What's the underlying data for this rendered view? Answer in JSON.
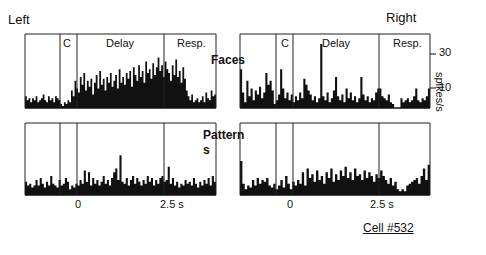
{
  "labels": {
    "left": "Left",
    "right": "Right",
    "faces": "Faces",
    "patterns_line1": "Pattern",
    "patterns_line2": "s",
    "epoch_c": "C",
    "epoch_delay": "Delay",
    "epoch_resp": "Resp.",
    "ytick_30": "30",
    "ytick_10": "10",
    "ylabel": "spikes/s",
    "xtick_0": "0",
    "xtick_25": "2.5 s",
    "cell": "Cell #532"
  },
  "chart_data": {
    "type": "bar",
    "title": "Cell #532",
    "ylabel": "spikes/s",
    "yticks": [
      10,
      30
    ],
    "xticks": [
      "0",
      "2.5 s"
    ],
    "epochs": [
      "C",
      "Delay",
      "Resp."
    ],
    "panels": [
      {
        "name": "Faces-Left",
        "row": "Faces",
        "side": "Left",
        "values": [
          6,
          4,
          5,
          3,
          5,
          4,
          6,
          3,
          4,
          5,
          7,
          4,
          3,
          6,
          4,
          5,
          3,
          6,
          5,
          4,
          2,
          1,
          3,
          2,
          4,
          3,
          9,
          6,
          14,
          10,
          8,
          16,
          12,
          18,
          9,
          14,
          11,
          15,
          7,
          13,
          17,
          10,
          19,
          12,
          15,
          9,
          16,
          13,
          18,
          11,
          14,
          17,
          10,
          20,
          13,
          16,
          12,
          18,
          15,
          19,
          11,
          21,
          17,
          14,
          22,
          16,
          19,
          13,
          24,
          18,
          20,
          15,
          23,
          17,
          21,
          26,
          19,
          22,
          16,
          24,
          20,
          18,
          14,
          22,
          17,
          25,
          16,
          19,
          13,
          21,
          15,
          9,
          6,
          4,
          7,
          3,
          4,
          5,
          3,
          4,
          6,
          3,
          8,
          5,
          4,
          9,
          6,
          7
        ]
      },
      {
        "name": "Faces-Right",
        "row": "Faces",
        "side": "Right",
        "values": [
          20,
          8,
          3,
          14,
          6,
          10,
          4,
          9,
          7,
          11,
          5,
          8,
          18,
          12,
          14,
          9,
          2,
          4,
          7,
          20,
          10,
          5,
          8,
          4,
          7,
          3,
          6,
          4,
          8,
          5,
          15,
          12,
          9,
          7,
          4,
          6,
          3,
          5,
          33,
          6,
          4,
          8,
          3,
          5,
          9,
          16,
          6,
          4,
          7,
          3,
          10,
          5,
          8,
          4,
          6,
          3,
          5,
          16,
          7,
          4,
          6,
          3,
          5,
          4,
          8,
          10,
          10,
          6,
          5,
          4,
          7,
          3,
          2,
          0,
          0,
          0,
          5,
          3,
          4,
          5,
          3,
          4,
          6,
          10,
          4,
          3,
          5,
          4,
          6,
          10
        ]
      },
      {
        "name": "Patterns-Left",
        "row": "Patterns",
        "side": "Left",
        "values": [
          7,
          5,
          6,
          4,
          5,
          8,
          5,
          9,
          6,
          4,
          7,
          5,
          10,
          6,
          5,
          4,
          8,
          5,
          6,
          9,
          7,
          3,
          5,
          4,
          6,
          5,
          8,
          6,
          13,
          7,
          12,
          5,
          9,
          6,
          8,
          5,
          7,
          10,
          6,
          8,
          5,
          9,
          12,
          14,
          8,
          21,
          7,
          6,
          9,
          5,
          8,
          10,
          6,
          9,
          7,
          5,
          8,
          6,
          10,
          7,
          9,
          5,
          8,
          6,
          9,
          10,
          7,
          8,
          15,
          6,
          9,
          5,
          7,
          4,
          6,
          5,
          8,
          6,
          7,
          5,
          9,
          6,
          4,
          7,
          5,
          8,
          6,
          9,
          5,
          10,
          7
        ]
      },
      {
        "name": "Patterns-Right",
        "row": "Patterns",
        "side": "Right",
        "values": [
          18,
          6,
          3,
          5,
          4,
          8,
          5,
          9,
          6,
          8,
          7,
          9,
          5,
          4,
          6,
          3,
          5,
          8,
          4,
          10,
          6,
          3,
          7,
          5,
          8,
          6,
          12,
          5,
          14,
          9,
          11,
          7,
          13,
          8,
          10,
          6,
          12,
          9,
          14,
          7,
          11,
          8,
          13,
          10,
          15,
          9,
          12,
          8,
          14,
          10,
          11,
          8,
          13,
          9,
          12,
          10,
          7,
          11,
          9,
          13,
          10,
          8,
          6,
          9,
          5,
          7,
          3,
          2,
          3,
          2,
          5,
          6,
          7,
          8,
          9,
          6,
          10,
          14,
          8,
          16
        ]
      }
    ],
    "ylim": [
      0,
      40
    ]
  }
}
